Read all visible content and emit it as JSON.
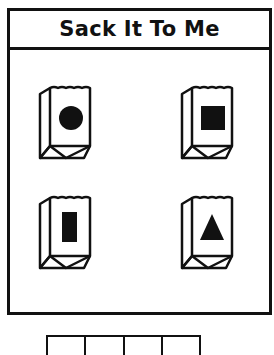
{
  "title": "Sack It To Me",
  "colors": {
    "ink": "#111111",
    "background": "#ffffff"
  },
  "sacks": [
    {
      "position": "top-left",
      "shape": "circle"
    },
    {
      "position": "top-right",
      "shape": "square"
    },
    {
      "position": "bottom-left",
      "shape": "rectangle"
    },
    {
      "position": "bottom-right",
      "shape": "triangle"
    }
  ],
  "answer_grid": {
    "cells": 4
  }
}
